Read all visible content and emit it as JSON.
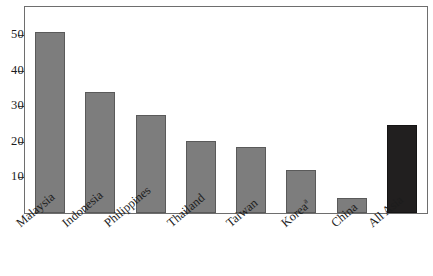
{
  "chart_data": {
    "type": "bar",
    "title": "",
    "subtitle": "",
    "xlabel": "",
    "ylabel": "",
    "categories": [
      "Malaysia",
      "Indonesia",
      "Philippines",
      "Thailand",
      "Taiwan",
      "Korea",
      "China",
      "All Asia"
    ],
    "category_notes": [
      "",
      "",
      "",
      "",
      "",
      "a",
      "",
      ""
    ],
    "values": [
      51,
      34.2,
      27.5,
      20.2,
      18.7,
      12,
      4.3,
      24.7
    ],
    "series": [
      {
        "name": "",
        "values": [
          51,
          34.2,
          27.5,
          20.2,
          18.7,
          12,
          4.3,
          24.7
        ]
      }
    ],
    "ylim": [
      0,
      58
    ],
    "yticks": [
      10,
      20,
      30,
      40,
      50
    ],
    "ytick_labels": [
      "10",
      "20",
      "30",
      "40",
      "50"
    ],
    "grid": false,
    "legend": null,
    "bar_colors": [
      "#7d7d7d",
      "#7d7d7d",
      "#7d7d7d",
      "#7d7d7d",
      "#7d7d7d",
      "#7d7d7d",
      "#7d7d7d",
      "#211f1f"
    ],
    "highlight_category": "All Asia",
    "highlight_color": "#211f1f",
    "default_bar_color": "#7d7d7d",
    "bar_border_color": "#4b4b4b",
    "frame_color": "#6e6e6e",
    "background_color": "#ffffff",
    "text_color": "#1c1c1c",
    "xlabel_rotation_degrees": -40
  }
}
